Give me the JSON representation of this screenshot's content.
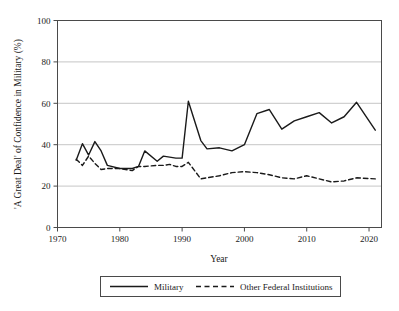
{
  "chart_data": {
    "type": "line",
    "title": "",
    "xlabel": "Year",
    "ylabel": "'A Great Deal' of Confidence in Military (%)",
    "xlim": [
      1970,
      2022
    ],
    "ylim": [
      0,
      100
    ],
    "xticks": [
      1970,
      1980,
      1990,
      2000,
      2010,
      2020
    ],
    "yticks": [
      0,
      20,
      40,
      60,
      80,
      100
    ],
    "grid": "horizontal",
    "legend_position": "bottom-outside",
    "series": [
      {
        "name": "Military",
        "style": "solid",
        "color": "#1a1a1a",
        "x": [
          1973,
          1974,
          1975,
          1976,
          1977,
          1978,
          1980,
          1982,
          1983,
          1984,
          1986,
          1987,
          1988,
          1989,
          1990,
          1991,
          1993,
          1994,
          1996,
          1998,
          2000,
          2002,
          2004,
          2006,
          2008,
          2010,
          2012,
          2014,
          2016,
          2018,
          2021
        ],
        "y": [
          32.5,
          40.5,
          35.0,
          41.5,
          37.0,
          30.0,
          28.5,
          28.5,
          29.5,
          37.0,
          32.0,
          34.5,
          34.0,
          33.5,
          33.5,
          61.0,
          42.0,
          38.0,
          38.5,
          37.0,
          40.0,
          55.0,
          57.0,
          47.5,
          51.5,
          53.5,
          55.5,
          50.5,
          53.5,
          60.5,
          47.0
        ]
      },
      {
        "name": "Other Federal Institutions",
        "style": "dashed",
        "color": "#1a1a1a",
        "x": [
          1973,
          1974,
          1975,
          1976,
          1977,
          1978,
          1980,
          1982,
          1983,
          1984,
          1986,
          1987,
          1988,
          1989,
          1990,
          1991,
          1993,
          1994,
          1996,
          1998,
          2000,
          2002,
          2004,
          2006,
          2008,
          2010,
          2012,
          2014,
          2016,
          2018,
          2021
        ],
        "y": [
          33.0,
          30.0,
          34.5,
          31.0,
          28.0,
          28.5,
          28.5,
          27.5,
          29.5,
          29.5,
          30.0,
          30.0,
          30.5,
          29.5,
          29.5,
          31.5,
          23.5,
          24.0,
          25.0,
          26.5,
          27.0,
          26.5,
          25.5,
          24.0,
          23.5,
          25.0,
          23.5,
          22.0,
          22.5,
          24.0,
          23.5
        ]
      }
    ]
  },
  "axes": {
    "y_title": "'A Great Deal' of Confidence in Military (%)",
    "x_title": "Year",
    "y_tick_labels": [
      "0",
      "20",
      "40",
      "60",
      "80",
      "100"
    ],
    "x_tick_labels": [
      "1970",
      "1980",
      "1990",
      "2000",
      "2010",
      "2020"
    ]
  },
  "legend": {
    "entries": [
      {
        "label": "Military",
        "style": "solid"
      },
      {
        "label": "Other Federal Institutions",
        "style": "dashed"
      }
    ]
  },
  "colors": {
    "line": "#1a1a1a",
    "grid": "#b8b8b8",
    "frame": "#4a4a4a",
    "background": "#ffffff"
  }
}
